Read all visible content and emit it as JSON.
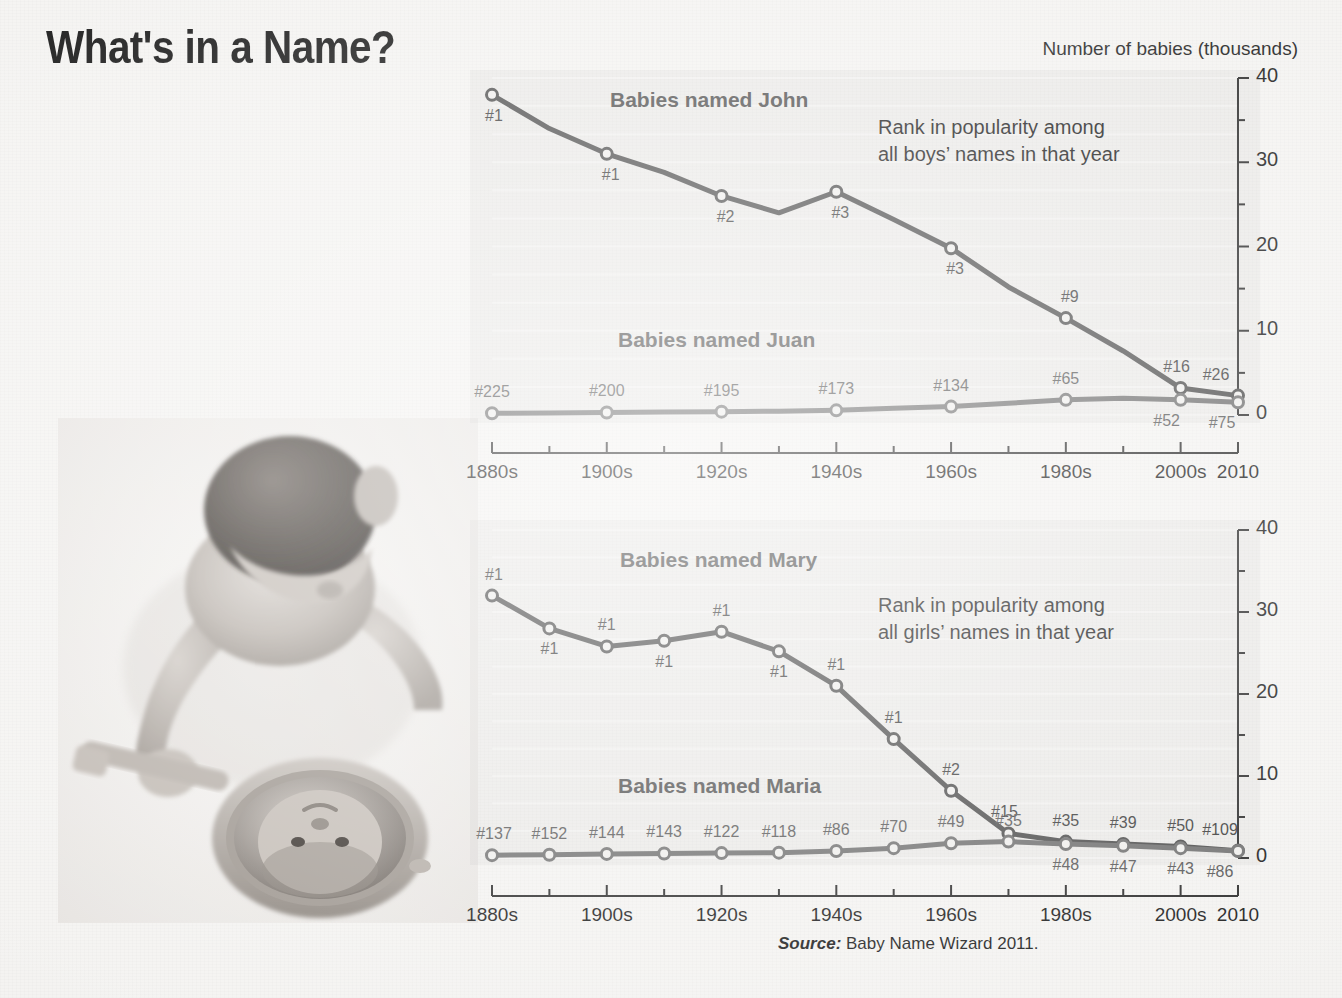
{
  "title": "What's in a Name?",
  "units_caption": "Number of babies (thousands)",
  "source": {
    "lead": "Source:",
    "text": " Baby Name Wizard 2011."
  },
  "photo": {
    "alt": "baby-looking-into-hand-mirror"
  },
  "colors": {
    "primary_line": "#4a4a4a",
    "secondary_line": "#6e6e6e",
    "plot_background": "#e8e6e4",
    "text": "#1b1b1b",
    "label_gray": "#555555"
  },
  "charts": [
    {
      "id": "boys",
      "annotation_line1": "Rank in popularity among",
      "annotation_line2": "all boys’ names in that year",
      "series_labels": {
        "upper": "Babies named John",
        "lower": "Babies named Juan"
      }
    },
    {
      "id": "girls",
      "annotation_line1": "Rank in popularity among",
      "annotation_line2": "all girls’ names in that year",
      "series_labels": {
        "upper": "Babies named Mary",
        "lower": "Babies named Maria"
      }
    }
  ],
  "chart_data": [
    {
      "type": "line",
      "title": "Babies named John / Babies named Juan",
      "xlabel": "",
      "ylabel": "Number of babies (thousands)",
      "ylim": [
        0,
        40
      ],
      "yticks": [
        0,
        10,
        20,
        30,
        40
      ],
      "yminorticks": [
        5,
        15,
        25,
        35
      ],
      "grid": false,
      "legend": "inline-labels",
      "x": [
        "1880s",
        "1890s",
        "1900s",
        "1910s",
        "1920s",
        "1930s",
        "1940s",
        "1950s",
        "1960s",
        "1970s",
        "1980s",
        "1990s",
        "2000s",
        "2010"
      ],
      "xtick_labels": [
        "1880s",
        "1900s",
        "1920s",
        "1940s",
        "1960s",
        "1980s",
        "2000s",
        "2010"
      ],
      "series": [
        {
          "name": "John",
          "values": [
            38.0,
            34.0,
            31.0,
            28.8,
            26.0,
            24.0,
            26.5,
            23.2,
            19.8,
            15.2,
            11.5,
            7.6,
            3.2,
            2.3
          ],
          "point_labels": [
            {
              "x": "1880s",
              "text": "#1"
            },
            {
              "x": "1900s",
              "text": "#1"
            },
            {
              "x": "1920s",
              "text": "#2"
            },
            {
              "x": "1940s",
              "text": "#3"
            },
            {
              "x": "1960s",
              "text": "#3"
            },
            {
              "x": "1980s",
              "text": "#9"
            },
            {
              "x": "2000s",
              "text": "#16"
            },
            {
              "x": "2010",
              "text": "#26"
            }
          ]
        },
        {
          "name": "Juan",
          "values": [
            0.2,
            0.25,
            0.3,
            0.35,
            0.4,
            0.45,
            0.55,
            0.8,
            1.0,
            1.4,
            1.8,
            2.0,
            1.8,
            1.5
          ],
          "point_labels": [
            {
              "x": "1880s",
              "text": "#225"
            },
            {
              "x": "1900s",
              "text": "#200"
            },
            {
              "x": "1920s",
              "text": "#195"
            },
            {
              "x": "1940s",
              "text": "#173"
            },
            {
              "x": "1960s",
              "text": "#134"
            },
            {
              "x": "1980s",
              "text": "#65"
            },
            {
              "x": "2000s",
              "text": "#52"
            },
            {
              "x": "2010",
              "text": "#75"
            }
          ]
        }
      ]
    },
    {
      "type": "line",
      "title": "Babies named Mary / Babies named Maria",
      "xlabel": "",
      "ylabel": "Number of babies (thousands)",
      "ylim": [
        0,
        40
      ],
      "yticks": [
        0,
        10,
        20,
        30,
        40
      ],
      "yminorticks": [
        5,
        15,
        25,
        35
      ],
      "grid": false,
      "legend": "inline-labels",
      "x": [
        "1880s",
        "1890s",
        "1900s",
        "1910s",
        "1920s",
        "1930s",
        "1940s",
        "1950s",
        "1960s",
        "1970s",
        "1980s",
        "1990s",
        "2000s",
        "2010"
      ],
      "xtick_labels": [
        "1880s",
        "1900s",
        "1920s",
        "1940s",
        "1960s",
        "1980s",
        "2000s",
        "2010"
      ],
      "series": [
        {
          "name": "Mary",
          "values": [
            32.0,
            28.0,
            25.8,
            26.5,
            27.6,
            25.2,
            21.0,
            14.5,
            8.2,
            3.0,
            2.0,
            1.7,
            1.4,
            0.9
          ],
          "point_labels": [
            {
              "x": "1880s",
              "text": "#1"
            },
            {
              "x": "1890s",
              "text": "#1"
            },
            {
              "x": "1900s",
              "text": "#1"
            },
            {
              "x": "1910s",
              "text": "#1"
            },
            {
              "x": "1920s",
              "text": "#1"
            },
            {
              "x": "1930s",
              "text": "#1"
            },
            {
              "x": "1940s",
              "text": "#1"
            },
            {
              "x": "1950s",
              "text": "#1"
            },
            {
              "x": "1960s",
              "text": "#2"
            },
            {
              "x": "1970s",
              "text": "#15"
            },
            {
              "x": "1980s",
              "text": "#35"
            },
            {
              "x": "1990s",
              "text": "#39"
            },
            {
              "x": "2000s",
              "text": "#50"
            },
            {
              "x": "2010",
              "text": "#109"
            }
          ]
        },
        {
          "name": "Maria",
          "values": [
            0.35,
            0.4,
            0.5,
            0.55,
            0.6,
            0.65,
            0.85,
            1.2,
            1.8,
            2.0,
            1.7,
            1.5,
            1.2,
            0.85
          ],
          "point_labels": [
            {
              "x": "1880s",
              "text": "#137"
            },
            {
              "x": "1890s",
              "text": "#152"
            },
            {
              "x": "1900s",
              "text": "#144"
            },
            {
              "x": "1910s",
              "text": "#143"
            },
            {
              "x": "1920s",
              "text": "#122"
            },
            {
              "x": "1930s",
              "text": "#118"
            },
            {
              "x": "1940s",
              "text": "#86"
            },
            {
              "x": "1950s",
              "text": "#70"
            },
            {
              "x": "1960s",
              "text": "#49"
            },
            {
              "x": "1970s",
              "text": "#35"
            },
            {
              "x": "1980s",
              "text": "#48"
            },
            {
              "x": "1990s",
              "text": "#47"
            },
            {
              "x": "2000s",
              "text": "#43"
            },
            {
              "x": "2010",
              "text": "#86"
            }
          ]
        }
      ]
    }
  ]
}
